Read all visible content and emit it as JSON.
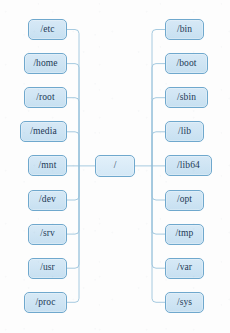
{
  "diagram": {
    "type": "tree",
    "root": {
      "label": "/",
      "name": "root-directory"
    },
    "colors": {
      "node_fill": "#cfe4f2",
      "node_border": "#6fa8cd",
      "node_text": "#1d3a56",
      "connector": "#9cc4dd",
      "background": "#fdfdfd"
    },
    "left_branch": [
      {
        "label": "/etc"
      },
      {
        "label": "/home"
      },
      {
        "label": "/root"
      },
      {
        "label": "/media"
      },
      {
        "label": "/mnt"
      },
      {
        "label": "/dev"
      },
      {
        "label": "/srv"
      },
      {
        "label": "/usr"
      },
      {
        "label": "/proc"
      }
    ],
    "right_branch": [
      {
        "label": "/bin"
      },
      {
        "label": "/boot"
      },
      {
        "label": "/sbin"
      },
      {
        "label": "/lib"
      },
      {
        "label": "/lib64"
      },
      {
        "label": "/opt"
      },
      {
        "label": "/tmp"
      },
      {
        "label": "/var"
      },
      {
        "label": "/sys"
      }
    ]
  }
}
